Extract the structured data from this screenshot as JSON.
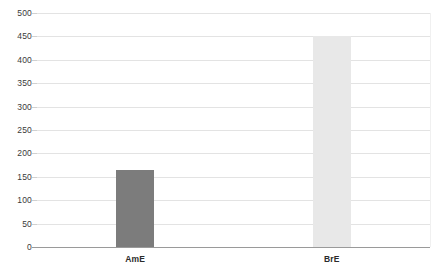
{
  "chart_data": {
    "type": "bar",
    "title": "",
    "subtitle": "",
    "xlabel": "",
    "ylabel": "",
    "categories": [
      "AmE",
      "BrE"
    ],
    "values": [
      165,
      450
    ],
    "ylim": [
      0,
      500
    ],
    "y_ticks": [
      0,
      50,
      100,
      150,
      200,
      250,
      300,
      350,
      400,
      450,
      500
    ],
    "y_tick_labels": [
      "0",
      "50",
      "100",
      "150",
      "200",
      "250",
      "300",
      "350",
      "400",
      "450",
      "500"
    ],
    "grid": true,
    "legend": false,
    "legend_position": "none",
    "bars": [
      {
        "category": "AmE",
        "value": 165,
        "color": "#7c7c7c"
      },
      {
        "category": "BrE",
        "value": 450,
        "color": "#e8e8e8"
      }
    ],
    "colors": {
      "bar_ame": "#7c7c7c",
      "bar_bre": "#e8e8e8",
      "gridline": "#e3e3e3",
      "axis_line": "#9a9a9a",
      "tick_text": "#3a3a3a",
      "category_text": "#2b2b2b",
      "background": "#ffffff"
    }
  }
}
